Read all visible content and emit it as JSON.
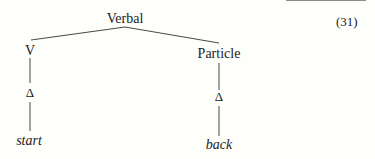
{
  "example_number": "(31)",
  "tree": {
    "root": {
      "label": "Verbal"
    },
    "children": [
      {
        "label": "V",
        "child": {
          "label": "Δ",
          "leaf": "start"
        }
      },
      {
        "label": "Particle",
        "child": {
          "label": "Δ",
          "leaf": "back"
        }
      }
    ]
  }
}
